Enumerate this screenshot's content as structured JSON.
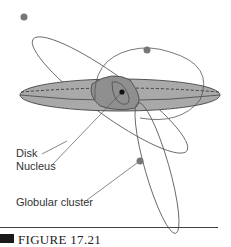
{
  "diagram": {
    "labels": {
      "disk": "Disk",
      "nucleus": "Nucleus",
      "globular_cluster": "Globular cluster"
    },
    "caption": "FIGURE 17.21",
    "colors": {
      "disk_fill": "#a9a9a9",
      "line": "#444444",
      "background": "#ffffff"
    }
  }
}
